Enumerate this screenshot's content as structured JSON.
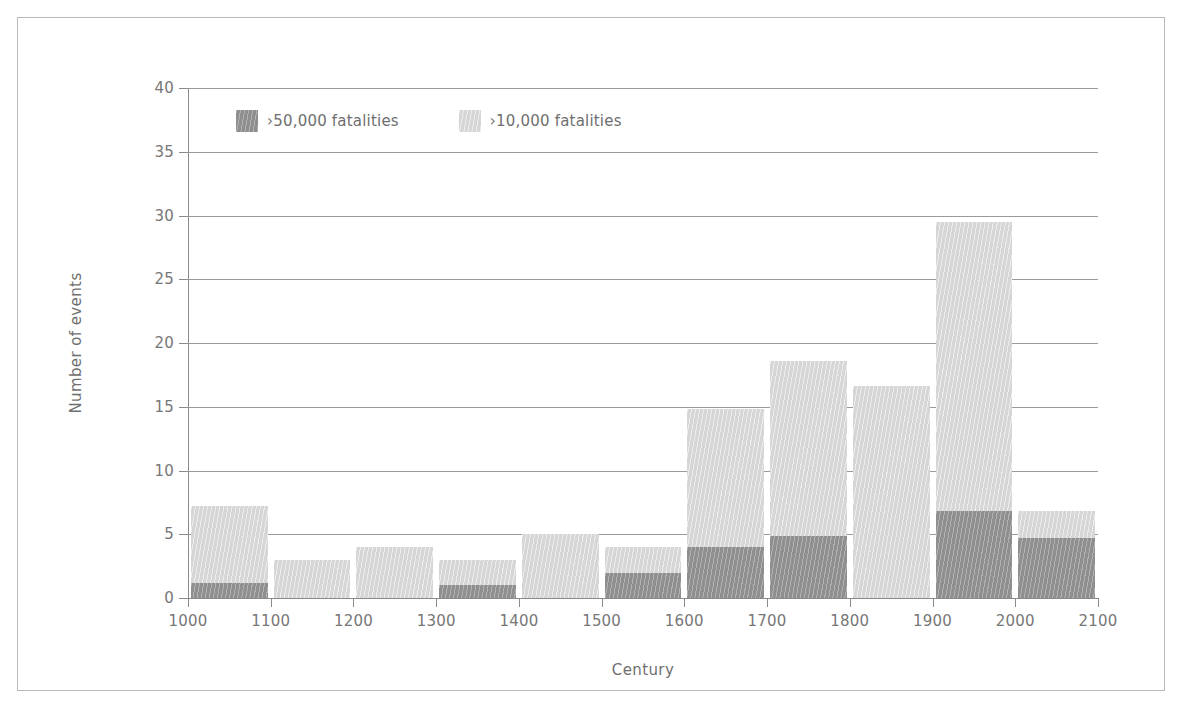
{
  "chart_data": {
    "type": "bar",
    "subtype": "stacked-bar-histogram",
    "title": "",
    "xlabel": "Century",
    "ylabel": "Number of events",
    "xlim": [
      1000,
      2100
    ],
    "ylim": [
      0,
      40
    ],
    "xticks": [
      "1000",
      "1100",
      "1200",
      "1300",
      "1400",
      "1500",
      "1600",
      "1700",
      "1800",
      "1900",
      "2000",
      "2100"
    ],
    "yticks": [
      "0",
      "5",
      "10",
      "15",
      "20",
      "25",
      "30",
      "35",
      "40"
    ],
    "ytick_step": 5,
    "grid": "horizontal",
    "legend_position": "upper-left-inside",
    "categories": [
      "1000",
      "1100",
      "1200",
      "1300",
      "1400",
      "1500",
      "1600",
      "1700",
      "1800",
      "1900",
      "2000"
    ],
    "bin_width": 100,
    "series": [
      {
        "name": ">50,000 fatalities",
        "color": "#8f8f8f",
        "values": [
          1.2,
          0,
          0,
          1.0,
          0,
          2.0,
          4.0,
          4.9,
          0,
          6.8,
          4.7
        ]
      },
      {
        "name": ">10,000 fatalities",
        "color": "#d6d6d6",
        "values": [
          6.0,
          3.0,
          4.0,
          2.0,
          5.0,
          2.0,
          10.8,
          13.7,
          16.6,
          22.7,
          2.1
        ]
      }
    ],
    "totals": [
      7.2,
      3.0,
      4.0,
      3.0,
      5.0,
      4.0,
      14.8,
      18.6,
      16.6,
      29.5,
      6.8
    ]
  },
  "legend": {
    "items": [
      {
        "label": "›50,000 fatalities",
        "swatch": "dark"
      },
      {
        "label": "›10,000 fatalities",
        "swatch": "light"
      }
    ]
  },
  "colors": {
    "dark_series": "#8f8f8f",
    "light_series": "#d6d6d6",
    "axis": "#8a8a8a",
    "gridline": "#9a9a9a",
    "text": "#6f6f6f",
    "frame_border": "#b9b9b9",
    "background": "#ffffff"
  }
}
